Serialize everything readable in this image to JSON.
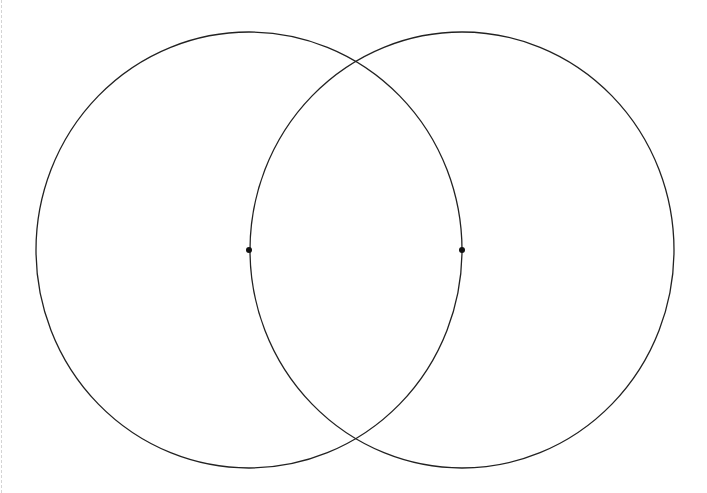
{
  "diagram": {
    "type": "two-circle-intersection",
    "stroke_color": "#222222",
    "background": "#ffffff",
    "circles": [
      {
        "name": "left-circle",
        "cx": 249,
        "cy": 250,
        "rx": 213,
        "ry": 218
      },
      {
        "name": "right-circle",
        "cx": 462,
        "cy": 250,
        "rx": 212,
        "ry": 218
      }
    ],
    "points": [
      {
        "name": "left-center-point",
        "x": 249,
        "y": 250
      },
      {
        "name": "right-center-point",
        "x": 462,
        "y": 250
      }
    ]
  }
}
